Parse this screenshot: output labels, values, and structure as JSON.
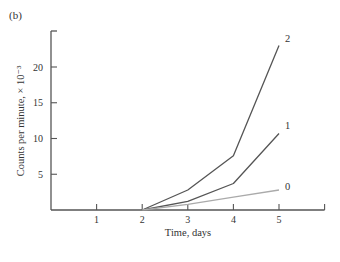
{
  "panel_label": "(b)",
  "chart_data": {
    "type": "line",
    "title": "",
    "panel": "(b)",
    "xlabel": "Time, days",
    "ylabel": "Counts per minute, × 10⁻³",
    "x_ticks": [
      1,
      2,
      3,
      4,
      5
    ],
    "y_ticks": [
      5,
      10,
      15,
      20
    ],
    "xlim": [
      0,
      6
    ],
    "ylim": [
      0,
      25
    ],
    "grid": false,
    "legend": "inline labels at line ends",
    "x": [
      2,
      3,
      4,
      5
    ],
    "series": [
      {
        "name": "2",
        "values": [
          0,
          2.8,
          7.6,
          23.0
        ],
        "color": "#555555"
      },
      {
        "name": "1",
        "values": [
          0,
          1.2,
          3.7,
          10.7
        ],
        "color": "#555555"
      },
      {
        "name": "0",
        "values": [
          0,
          0.8,
          1.8,
          2.8
        ],
        "color": "#aaaaaa"
      }
    ]
  }
}
